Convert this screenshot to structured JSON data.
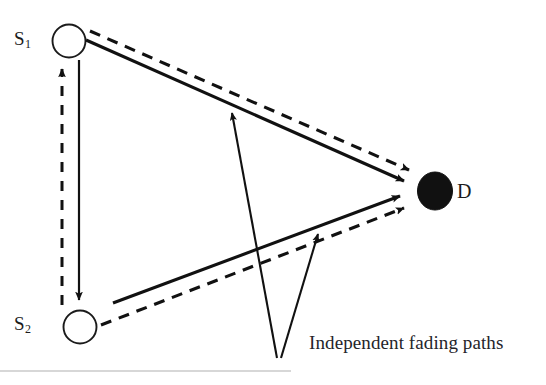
{
  "figure": {
    "background_color": "#ffffff",
    "stroke_color": "#111111",
    "text_color": "#24242a",
    "rule_color": "#c9c9c9",
    "nodes": [
      {
        "id": "s1",
        "label_text": "S",
        "label_subscript": "1",
        "shape": "circle-outline",
        "cx": 69,
        "cy": 41,
        "r": 17
      },
      {
        "id": "s2",
        "label_text": "S",
        "label_subscript": "2",
        "shape": "circle-outline",
        "cx": 80,
        "cy": 327,
        "r": 17
      },
      {
        "id": "d",
        "label_text": "D",
        "label_subscript": "",
        "shape": "circle-filled",
        "cx": 435,
        "cy": 191,
        "r": 18
      }
    ],
    "edges": [
      {
        "id": "s1-to-d-solid",
        "style": "solid",
        "from": "s1",
        "to": "d"
      },
      {
        "id": "s1-to-d-dashed",
        "style": "dashed",
        "from": "s1",
        "to": "d"
      },
      {
        "id": "s2-to-d-solid",
        "style": "solid",
        "from": "s2",
        "to": "d"
      },
      {
        "id": "s2-to-d-dashed",
        "style": "dashed",
        "from": "s2",
        "to": "d"
      },
      {
        "id": "s2-to-s1-dashed",
        "style": "dashed",
        "from": "s2",
        "to": "s1"
      },
      {
        "id": "s1-to-s2-solid",
        "style": "solid",
        "from": "s1",
        "to": "s2"
      }
    ],
    "annotation": {
      "text": "Independent fading paths",
      "pointer_targets": [
        "s1-to-d-solid",
        "s2-to-d-solid"
      ]
    },
    "bottom_rule": {
      "x1": 0,
      "x2": 291,
      "y": 371
    }
  }
}
